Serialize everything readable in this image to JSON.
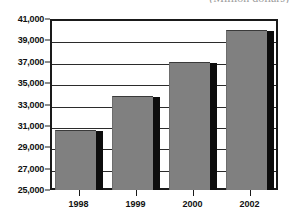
{
  "chart_data": {
    "type": "bar",
    "title": "(Million dollars)",
    "title_clipped": true,
    "xlabel": "",
    "ylabel": "",
    "categories": [
      "1998",
      "1999",
      "2000",
      "2002"
    ],
    "values": [
      30500,
      33700,
      36900,
      39900
    ],
    "ylim": [
      25000,
      41000
    ],
    "ytick_step": 2000,
    "ytick_labels": [
      "25,000",
      "27,000",
      "29,000",
      "31,000",
      "33,000",
      "35,000",
      "37,000",
      "39,000",
      "41,000"
    ],
    "ytick_values": [
      25000,
      27000,
      29000,
      31000,
      33000,
      35000,
      37000,
      39000,
      41000
    ],
    "grid": true,
    "grid_axis": "y",
    "legend": false,
    "series": [
      {
        "name": "",
        "values": [
          30500,
          33700,
          36900,
          39900
        ]
      }
    ],
    "colors": {
      "bar_fill": "#808080",
      "bar_shadow": "#0d0d0d",
      "frame": "#1a1a1a",
      "gridline": "#2b2b2b",
      "background": "#ffffff",
      "text": "#111111"
    }
  }
}
